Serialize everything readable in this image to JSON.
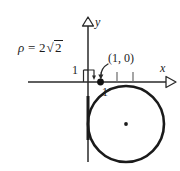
{
  "figure": {
    "title_label": "",
    "equation": {
      "symbol": "ρ",
      "relation": "=",
      "coefficient": "2",
      "radical_sign": "√",
      "radicand": "2",
      "full_text": "ρ = 2√2"
    },
    "axes": {
      "x_label": "x",
      "y_label": "y",
      "x_axis_y_px": 82,
      "y_axis_x_px": 88,
      "arrowhead_style": "open-triangle"
    },
    "tick_labels": {
      "y_one": "1",
      "x_one": "1"
    },
    "point_annotation": {
      "label": "(1, 0)",
      "x_value": 1,
      "y_value": 0,
      "marker": "filled-dot",
      "arrow": "curved-down-left"
    },
    "circle": {
      "center_label": "",
      "center_marker": "filled-dot",
      "center_px": [
        126,
        124
      ],
      "radius_px": 38,
      "stroke_color": "#1a1a1a",
      "stroke_width_px": 2.6,
      "fill": "none",
      "passes_through": "(1, 0)"
    },
    "x_ticks_px": [
      117,
      133
    ],
    "colors": {
      "ink": "#1c1c1c",
      "background": "#ffffff",
      "curve": "#1a1a1a"
    }
  }
}
